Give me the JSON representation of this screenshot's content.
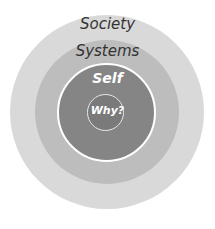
{
  "diagram": {
    "type": "concentric-circles",
    "layers": [
      {
        "label": "Society",
        "color": "#d9d9d9"
      },
      {
        "label": "Systems",
        "color": "#bdbdbd"
      },
      {
        "label": "Self",
        "color": "#8a8a8a"
      },
      {
        "label": "Why?",
        "color": "#7f7f7f"
      }
    ]
  }
}
